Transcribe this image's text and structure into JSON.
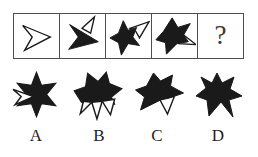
{
  "puzzle": {
    "colors": {
      "ink": "#1a1a1a",
      "grid_border": "#4f4f4f",
      "background": "#ffffff"
    },
    "sequence": {
      "cells": [
        {
          "icon": "chevron-outline-icon"
        },
        {
          "icon": "dart-black-with-outline-point-icon"
        },
        {
          "icon": "star-black-with-outline-chevron-icon"
        },
        {
          "icon": "star-black-with-outline-triangle-icon"
        },
        {
          "icon": "question-mark"
        }
      ],
      "question_symbol": "?"
    },
    "options": [
      {
        "letter": "A",
        "icon": "star-black-white-chevron-notch-icon"
      },
      {
        "letter": "B",
        "icon": "star-black-top-white-points-bottom-icon"
      },
      {
        "letter": "C",
        "icon": "star-black-white-triangle-bottom-icon"
      },
      {
        "letter": "D",
        "icon": "star-solid-black-notched-icon"
      }
    ]
  }
}
